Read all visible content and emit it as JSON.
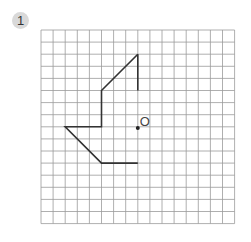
{
  "problem": {
    "number": "1"
  },
  "grid": {
    "left": 41,
    "top": 30,
    "cols": 16,
    "rows": 16,
    "cell": 12.1,
    "line_color": "#9a9a9a"
  },
  "figure": {
    "stroke_color": "#333333",
    "points_grid": [
      [
        8,
        2
      ],
      [
        5,
        5
      ],
      [
        5,
        8
      ],
      [
        2,
        8
      ],
      [
        5,
        11
      ],
      [
        8,
        11
      ]
    ],
    "open_start_segment": [
      [
        8,
        2
      ],
      [
        8,
        5
      ]
    ]
  },
  "center_point": {
    "grid": [
      8,
      8.1
    ],
    "label": "O"
  }
}
